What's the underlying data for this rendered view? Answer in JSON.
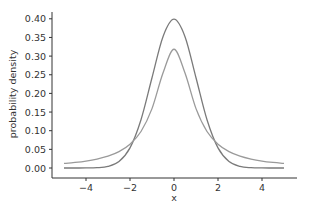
{
  "chart_data": {
    "type": "line",
    "title": "",
    "xlabel": "x",
    "ylabel": "probability density",
    "xlim": [
      -5.5,
      5.6
    ],
    "ylim": [
      0.0,
      0.42
    ],
    "grid": false,
    "legend": null,
    "x_ticks": [
      -4,
      -2,
      0,
      2,
      4
    ],
    "x_tick_labels": [
      "−4",
      "−2",
      "0",
      "2",
      "4"
    ],
    "y_ticks": [
      0.0,
      0.05,
      0.1,
      0.15,
      0.2,
      0.25,
      0.3,
      0.35,
      0.4
    ],
    "y_tick_labels": [
      "0.00",
      "0.05",
      "0.10",
      "0.15",
      "0.20",
      "0.25",
      "0.30",
      "0.35",
      "0.40"
    ],
    "x": [
      -5,
      -4.5,
      -4,
      -3.5,
      -3,
      -2.5,
      -2,
      -1.5,
      -1,
      -0.5,
      0,
      0.5,
      1,
      1.5,
      2,
      2.5,
      3,
      3.5,
      4,
      4.5,
      5
    ],
    "series": [
      {
        "name": "normal",
        "color": "#7a7a7a",
        "values": [
          0.0,
          0.0,
          0.0001,
          0.0009,
          0.0044,
          0.0175,
          0.054,
          0.1295,
          0.242,
          0.3521,
          0.3989,
          0.3521,
          0.242,
          0.1295,
          0.054,
          0.0175,
          0.0044,
          0.0009,
          0.0001,
          0.0,
          0.0
        ]
      },
      {
        "name": "cauchy",
        "color": "#9a9a9a",
        "values": [
          0.0122,
          0.015,
          0.0187,
          0.0241,
          0.0318,
          0.0439,
          0.0637,
          0.0979,
          0.1592,
          0.2546,
          0.3183,
          0.2546,
          0.1592,
          0.0979,
          0.0637,
          0.0439,
          0.0318,
          0.0241,
          0.0187,
          0.015,
          0.0122
        ]
      }
    ]
  },
  "colors": {
    "axis": "#333333",
    "text": "#333333"
  }
}
